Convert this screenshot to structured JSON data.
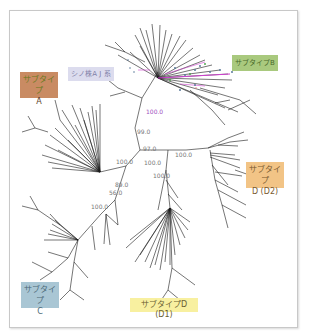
{
  "figure": {
    "type": "unrooted phylogenetic tree",
    "colors": {
      "frame_border": "#c8c8c8",
      "branch": "#1a1a1a",
      "highlight_branch": "#d040d0",
      "subtype_a_bg": "#c98b63",
      "sino_bg": "#dcdcee",
      "subtype_b_bg": "#a9c97e",
      "subtype_d2_bg": "#f2c486",
      "subtype_c_bg": "#a9c6d4",
      "subtype_d1_bg": "#f8f0a0"
    }
  },
  "labels": {
    "subtype_a": {
      "line1": "サブタイプ",
      "line2": "A"
    },
    "sino": {
      "text": "シノ株A J 系"
    },
    "subtype_b": {
      "text": "サブタイプB"
    },
    "subtype_d2": {
      "line1": "サブタイプ",
      "line2": "D (D2)"
    },
    "subtype_c": {
      "line1": "サブタイプ",
      "line2": "C"
    },
    "subtype_d1": {
      "text": "サブタイプD (D1)"
    }
  },
  "bootstrap": {
    "b1": "100.0",
    "b2": "99.0",
    "b3": "97.0",
    "b4": "100.0",
    "b5": "100.0",
    "b6": "100.0",
    "b7": "100.0",
    "b8": "89.0",
    "b9": "56.0",
    "b10": "100.0"
  }
}
